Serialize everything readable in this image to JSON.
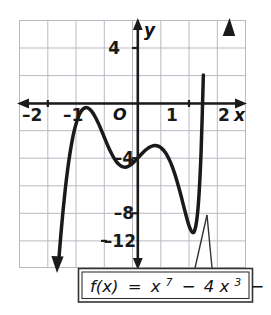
{
  "figure": {
    "callout": {
      "text_plain": "f(x) = x^7 - 4x^3 - 5",
      "fx": "f(x)",
      "equals": "=",
      "term1_base": "x",
      "term1_exp": "7",
      "minus1": "−",
      "term2_coef": "4",
      "term2_base": "x",
      "term2_exp": "3",
      "minus2": "−",
      "constant": "5"
    },
    "axis_labels": {
      "x_letter": "x",
      "y_letter": "y",
      "origin": "O"
    },
    "x_ticks": [
      {
        "value": -2,
        "label": "–2"
      },
      {
        "value": -1,
        "label": "–1"
      },
      {
        "value": 1,
        "label": "1"
      },
      {
        "value": 2,
        "label": "2"
      }
    ],
    "y_ticks": [
      {
        "value": 4,
        "label": "4"
      },
      {
        "value": -4,
        "label": "–4"
      },
      {
        "value": -8,
        "label": "–8"
      },
      {
        "value": -12,
        "label": "–12"
      }
    ],
    "colors": {
      "grid": "#b9b9c4",
      "axis": "#1a1a1a",
      "curve": "#1a1a1a",
      "background": "#ffffff",
      "callout_border": "#333333"
    }
  },
  "chart_data": {
    "type": "line",
    "title": "",
    "subtitle": "",
    "xlabel": "x",
    "ylabel": "y",
    "xlim": [
      -2.125,
      1.9375
    ],
    "ylim": [
      -14.85,
      6.0
    ],
    "grid": true,
    "legend": "none",
    "annotations": [
      {
        "text": "f(x) = x⁷ − 4x³ − 5",
        "points_to": {
          "x": 1.1,
          "y": -8.7
        },
        "placement": "below-axes"
      }
    ],
    "axis_ranges": {
      "x_major_tick_step": 1,
      "y_major_tick_step": 4,
      "x_grid_step": 0.5,
      "y_grid_step": 2
    },
    "function": "f(x) = x^7 - 4x^3 - 5",
    "key_features": [
      {
        "name": "local-maximum",
        "x": -1.07,
        "y": -1.3
      },
      {
        "name": "inflection-plateau",
        "x": 0.0,
        "y": -5.0
      },
      {
        "name": "local-minimum",
        "x": 1.07,
        "y": -8.7
      },
      {
        "name": "x-intercept",
        "x": 1.43,
        "y": 0
      }
    ],
    "series": [
      {
        "name": "f(x) = x^7 - 4x^3 - 5",
        "x": [
          -1.42,
          -1.38,
          -1.34,
          -1.3,
          -1.26,
          -1.22,
          -1.18,
          -1.14,
          -1.1,
          -1.06,
          -1.02,
          -0.98,
          -0.94,
          -0.9,
          -0.86,
          -0.82,
          -0.78,
          -0.74,
          -0.7,
          -0.66,
          -0.62,
          -0.58,
          -0.54,
          -0.5,
          -0.46,
          -0.42,
          -0.38,
          -0.34,
          -0.3,
          -0.26,
          -0.22,
          -0.18,
          -0.14,
          -0.1,
          -0.06,
          -0.02,
          0.02,
          0.06,
          0.1,
          0.14,
          0.18,
          0.22,
          0.26,
          0.3,
          0.34,
          0.38,
          0.42,
          0.46,
          0.5,
          0.54,
          0.58,
          0.62,
          0.66,
          0.7,
          0.74,
          0.78,
          0.82,
          0.86,
          0.9,
          0.94,
          0.98,
          1.02,
          1.06,
          1.1,
          1.14,
          1.18,
          1.22,
          1.26,
          1.3,
          1.34,
          1.38,
          1.42,
          1.46,
          1.5
        ],
        "y": [
          -14.3,
          -12.0,
          -9.95,
          -8.15,
          -6.6,
          -5.28,
          -4.18,
          -3.28,
          -2.58,
          -2.05,
          -1.68,
          -1.46,
          -1.36,
          -1.38,
          -1.5,
          -1.71,
          -2.0,
          -2.35,
          -2.75,
          -3.19,
          -3.64,
          -4.1,
          -4.54,
          -4.96,
          -5.33,
          -5.66,
          -5.93,
          -6.14,
          -6.28,
          -6.36,
          -6.38,
          -6.33,
          -6.23,
          -6.09,
          -5.91,
          -5.72,
          -5.51,
          -5.31,
          -5.12,
          -4.94,
          -4.8,
          -4.68,
          -4.6,
          -4.56,
          -4.57,
          -4.63,
          -4.75,
          -4.93,
          -5.17,
          -5.49,
          -5.87,
          -6.33,
          -6.86,
          -7.46,
          -8.12,
          -8.82,
          -9.56,
          -10.29,
          -10.98,
          -11.55,
          -11.88,
          -11.77,
          -10.9,
          -8.84,
          -4.98,
          1.4,
          11.2,
          25.6,
          46.0,
          74.3,
          112.9,
          164.8,
          233.5,
          322.9
        ]
      }
    ]
  }
}
